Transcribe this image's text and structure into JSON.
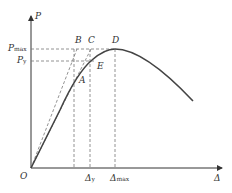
{
  "diagram": {
    "type": "load-displacement curve",
    "axes": {
      "y_label": "P",
      "x_label": "Δ",
      "origin_label": "O"
    },
    "y_ticks": [
      {
        "main": "P",
        "sub": "max"
      },
      {
        "main": "P",
        "sub": "y"
      }
    ],
    "x_ticks": [
      {
        "main": "Δ",
        "sub": "y"
      },
      {
        "main": "Δ",
        "sub": "max"
      }
    ],
    "points": {
      "A": "A",
      "B": "B",
      "C": "C",
      "D": "D",
      "E": "E"
    },
    "colors": {
      "curve": "#444444",
      "axis": "#333333",
      "dashed": "#777777"
    }
  }
}
